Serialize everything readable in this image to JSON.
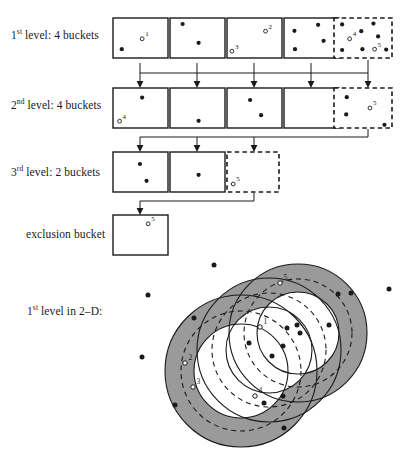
{
  "figure": {
    "labels": {
      "level1": {
        "prefix": "1",
        "sup": "st",
        "rest": " level: 4 buckets"
      },
      "level2": {
        "prefix": "2",
        "sup": "nd",
        "rest": " level: 4 buckets"
      },
      "level3": {
        "prefix": "3",
        "sup": "rd",
        "rest": " level: 2 buckets"
      },
      "exclusion": "exclusion bucket",
      "level1_2d": {
        "prefix": "1",
        "sup": "st",
        "rest": " level in 2–D:"
      }
    },
    "colors": {
      "stroke": "#1a1a1a",
      "annulus_fill": "#9a9a9a",
      "background": "#ffffff",
      "point_fill": "#1a1a1a",
      "open_point_fill": "#ffffff"
    },
    "rows": [
      {
        "name": "level-1",
        "y": 18,
        "box_w": 55,
        "box_h": 40,
        "boxes": [
          {
            "x": 113,
            "style": "solid",
            "filled_points": [
              [
                0.16,
                0.78
              ]
            ],
            "open_points": [
              [
                0.53,
                0.52
              ]
            ],
            "open_labels": [
              "1"
            ]
          },
          {
            "x": 170,
            "style": "solid",
            "filled_points": [
              [
                0.23,
                0.15
              ],
              [
                0.52,
                0.62
              ]
            ],
            "open_points": [],
            "open_labels": []
          },
          {
            "x": 227,
            "style": "solid",
            "filled_points": [],
            "open_points": [
              [
                0.09,
                0.83
              ],
              [
                0.7,
                0.33
              ]
            ],
            "open_labels": [
              "3",
              "2"
            ]
          },
          {
            "x": 284,
            "style": "solid",
            "filled_points": [
              [
                0.19,
                0.32
              ],
              [
                0.2,
                0.78
              ],
              [
                0.62,
                0.17
              ],
              [
                0.72,
                0.57
              ]
            ],
            "open_points": [],
            "open_labels": []
          },
          {
            "x": 334,
            "style": "dashed",
            "w": 58,
            "filled_points": [
              [
                0.14,
                0.16
              ],
              [
                0.14,
                0.8
              ],
              [
                0.47,
                0.33
              ],
              [
                0.49,
                0.78
              ],
              [
                0.68,
                0.14
              ],
              [
                0.76,
                0.46
              ],
              [
                0.9,
                0.79
              ]
            ],
            "open_points": [
              [
                0.27,
                0.52
              ],
              [
                0.7,
                0.78
              ]
            ],
            "open_labels": [
              "4",
              "5"
            ]
          }
        ]
      },
      {
        "name": "level-2",
        "y": 88,
        "box_w": 55,
        "box_h": 40,
        "boxes": [
          {
            "x": 113,
            "style": "solid",
            "filled_points": [
              [
                0.53,
                0.24
              ]
            ],
            "open_points": [
              [
                0.12,
                0.83
              ]
            ],
            "open_labels": [
              "4"
            ]
          },
          {
            "x": 170,
            "style": "solid",
            "filled_points": [
              [
                0.52,
                0.82
              ]
            ],
            "open_points": [],
            "open_labels": []
          },
          {
            "x": 227,
            "style": "solid",
            "filled_points": [
              [
                0.42,
                0.3
              ],
              [
                0.62,
                0.68
              ]
            ],
            "open_points": [],
            "open_labels": []
          },
          {
            "x": 284,
            "style": "solid",
            "filled_points": [],
            "open_points": [],
            "open_labels": []
          },
          {
            "x": 334,
            "style": "dashed",
            "w": 58,
            "filled_points": [
              [
                0.22,
                0.23
              ],
              [
                0.21,
                0.66
              ],
              [
                0.87,
                0.92
              ]
            ],
            "open_points": [
              [
                0.62,
                0.5
              ]
            ],
            "open_labels": [
              "5"
            ]
          }
        ]
      },
      {
        "name": "level-3",
        "y": 152,
        "box_w": 55,
        "box_h": 40,
        "boxes": [
          {
            "x": 113,
            "style": "solid",
            "filled_points": [
              [
                0.49,
                0.3
              ],
              [
                0.61,
                0.72
              ]
            ],
            "open_points": [],
            "open_labels": []
          },
          {
            "x": 170,
            "style": "solid",
            "filled_points": [
              [
                0.52,
                0.57
              ]
            ],
            "open_points": [],
            "open_labels": []
          },
          {
            "x": 227,
            "style": "dashed",
            "w": 52,
            "filled_points": [],
            "open_points": [
              [
                0.12,
                0.8
              ]
            ],
            "open_labels": [
              "5"
            ]
          }
        ]
      },
      {
        "name": "exclusion",
        "y": 215,
        "box_w": 55,
        "box_h": 40,
        "boxes": [
          {
            "x": 113,
            "style": "solid",
            "filled_points": [],
            "open_points": [
              [
                0.64,
                0.22
              ]
            ],
            "open_labels": [
              "5"
            ]
          }
        ]
      }
    ],
    "diagram2d": {
      "annuli": [
        {
          "name": "annulus-left",
          "cx": 241,
          "cy": 371,
          "r_outer": 76,
          "r_mid": 60,
          "r_inner": 47
        },
        {
          "name": "annulus-mid",
          "cx": 269,
          "cy": 350,
          "r_outer": 72,
          "r_mid": 57,
          "r_inner": 43
        },
        {
          "name": "annulus-right",
          "cx": 298,
          "cy": 333,
          "r_outer": 69,
          "r_mid": 54,
          "r_inner": 41
        }
      ],
      "filled_points": [
        [
          214,
          265
        ],
        [
          148,
          295
        ],
        [
          194,
          318
        ],
        [
          272,
          356
        ],
        [
          338,
          294
        ],
        [
          351,
          293
        ],
        [
          287,
          328
        ],
        [
          300,
          333
        ],
        [
          297,
          325
        ],
        [
          329,
          325
        ],
        [
          283,
          346
        ],
        [
          249,
          343
        ],
        [
          142,
          357
        ],
        [
          264,
          403
        ],
        [
          283,
          396
        ],
        [
          175,
          405
        ],
        [
          284,
          428
        ],
        [
          389,
          289
        ]
      ],
      "open_points": [
        {
          "x": 260,
          "y": 327,
          "label": "1"
        },
        {
          "x": 185,
          "y": 363,
          "label": "2"
        },
        {
          "x": 193,
          "y": 387,
          "label": "3"
        },
        {
          "x": 255,
          "y": 396,
          "label": "4"
        },
        {
          "x": 280,
          "y": 283,
          "label": "5"
        }
      ]
    }
  }
}
